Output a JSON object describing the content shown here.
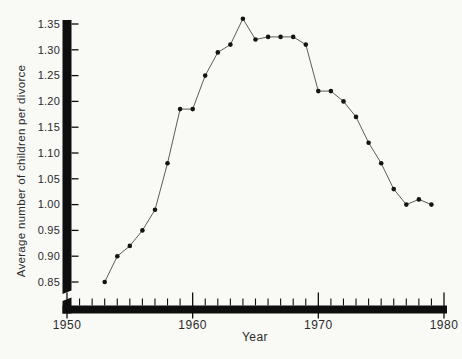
{
  "chart_data": {
    "type": "line",
    "title": "",
    "xlabel": "Year",
    "ylabel": "Average number of children per divorce",
    "x": [
      1953,
      1954,
      1955,
      1956,
      1957,
      1958,
      1959,
      1960,
      1961,
      1962,
      1963,
      1964,
      1965,
      1966,
      1967,
      1968,
      1969,
      1970,
      1971,
      1972,
      1973,
      1974,
      1975,
      1976,
      1977,
      1978,
      1979
    ],
    "y": [
      0.85,
      0.9,
      0.92,
      0.95,
      0.99,
      1.08,
      1.185,
      1.185,
      1.25,
      1.295,
      1.31,
      1.36,
      1.32,
      1.325,
      1.325,
      1.325,
      1.31,
      1.22,
      1.22,
      1.2,
      1.17,
      1.12,
      1.08,
      1.03,
      1.0,
      1.01,
      1.0
    ],
    "xlim": [
      1950,
      1980
    ],
    "ylim": [
      0.85,
      1.35
    ],
    "x_tick_labels": [
      "1950",
      "1960",
      "1970",
      "1980"
    ],
    "x_ticks_labeled_years": [
      1950,
      1960,
      1970,
      1980
    ],
    "x_minor_tick_interval_years": 1,
    "y_tick_interval": 0.05,
    "y_tick_labels": [
      "1.35",
      "1.30",
      "1.25",
      "1.20",
      "1.15",
      "1.10",
      "1.05",
      "1.00",
      "0.95",
      "0.90",
      "0.85"
    ],
    "y_tick_values": [
      1.35,
      1.3,
      1.25,
      1.2,
      1.15,
      1.1,
      1.05,
      1.0,
      0.95,
      0.9,
      0.85
    ],
    "axis_break": "y-axis broken below 0.85 near origin",
    "grid": false,
    "legend": null,
    "marker": "filled-circle",
    "colors": {
      "axis_ink": "#0e0e0e",
      "line": "#4a4a4a",
      "marker": "#141414",
      "label_text": "#2b2b2b",
      "background": "#f9f9f6"
    }
  }
}
